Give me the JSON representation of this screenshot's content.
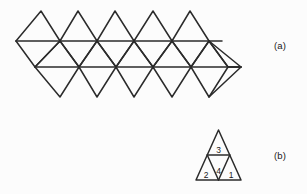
{
  "figure": {
    "background_color": "#fcfcfc",
    "stroke_color": "#2b2b2b",
    "text_color": "#1a1a1a"
  },
  "panels": [
    {
      "key": "a",
      "label": "(a)",
      "name": "triangular-strip-net",
      "description": "Unfolded strip net of tessellated equilateral triangles, two rows",
      "geometry": {
        "rows": 2,
        "top_peak_count": 5,
        "bottom_valley_count": 5,
        "top_peak_y": 11,
        "upper_horizontal_y": 41,
        "lower_horizontal_y": 67,
        "bottom_valley_y": 97,
        "upper_horizontal_x_start": 16,
        "upper_horizontal_x_end": 222,
        "lower_horizontal_x_start": 35,
        "lower_horizontal_x_end": 241,
        "cell_half_width": 18.7,
        "top_peaks_x": [
          41,
          78,
          115,
          153,
          190
        ],
        "bottom_valleys_x": [
          60,
          97,
          134,
          172,
          209
        ]
      }
    },
    {
      "key": "b",
      "label": "(b)",
      "name": "folded-triangle-faces",
      "description": "Large equilateral triangle subdivided into four numbered small triangles",
      "geometry": {
        "apex_x": 218.5,
        "apex_y": 130,
        "base_left_x": 196,
        "base_right_x": 241,
        "base_y": 180,
        "midline_y": 155
      },
      "cells": [
        {
          "id": "top",
          "label": "3",
          "x": 218.5,
          "y": 149.5
        },
        {
          "id": "bottom-left",
          "label": "2",
          "x": 206.0,
          "y": 174.5
        },
        {
          "id": "center",
          "label": "4",
          "x": 218.5,
          "y": 170.5
        },
        {
          "id": "bottom-right",
          "label": "1",
          "x": 231.0,
          "y": 174.5
        }
      ]
    }
  ]
}
